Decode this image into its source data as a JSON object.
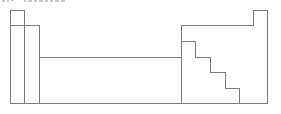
{
  "diagram": {
    "type": "periodic-table-outline",
    "caption": {
      "text": "",
      "note": "clipped at top edge, illegible"
    },
    "stroke_color": "#7a7a7a",
    "background": "#ffffff",
    "regions": [
      {
        "name": "s-block-group-1",
        "x": 10,
        "y": 10,
        "w": 14,
        "h": 93
      },
      {
        "name": "s-block-group-2",
        "x": 24,
        "y": 25,
        "w": 15,
        "h": 78
      },
      {
        "name": "d-block",
        "x": 39,
        "y": 57,
        "w": 142,
        "h": 46
      },
      {
        "name": "p-block",
        "x": 181,
        "y": 25,
        "w": 72,
        "h": 78
      },
      {
        "name": "group-18-top",
        "x": 253,
        "y": 10,
        "w": 14,
        "h": 93
      }
    ],
    "staircase": [
      [
        181,
        41
      ],
      [
        195,
        41
      ],
      [
        195,
        57
      ],
      [
        210,
        57
      ],
      [
        210,
        72
      ],
      [
        225,
        72
      ],
      [
        225,
        88
      ],
      [
        239,
        88
      ],
      [
        239,
        103
      ]
    ]
  }
}
